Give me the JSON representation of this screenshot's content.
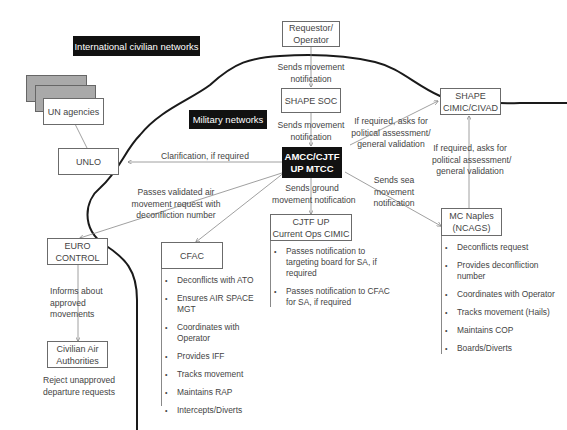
{
  "regions": {
    "civilian_label": "International civilian networks",
    "military_label": "Military networks"
  },
  "nodes": {
    "requestor": "Requestor/ Operator",
    "shape_soc": "SHAPE SOC",
    "amcc_line1": "AMCC/CJTF",
    "amcc_line2": "UP MTCC",
    "shape_cimic_line1": "SHAPE",
    "shape_cimic_line2": "CIMIC/CIVAD",
    "un_agencies": "UN agencies",
    "unlo": "UNLO",
    "euro_line1": "EURO",
    "euro_line2": "CONTROL",
    "civil_line1": "Civilian Air",
    "civil_line2": "Authorities",
    "cfac": "CFAC",
    "cjtf_line1": "CJTF UP",
    "cjtf_line2": "Current Ops CIMIC",
    "mc_line1": "MC Naples",
    "mc_line2": "(NCAGS)"
  },
  "edges": {
    "req_to_soc": [
      "Sends movement",
      "notification"
    ],
    "soc_to_amcc": [
      "Sends movement",
      "notification"
    ],
    "amcc_to_shape": [
      "If required, asks for",
      "political assessment/",
      "general validation"
    ],
    "mc_to_shape": [
      "If required, asks for",
      "political assessment/",
      "general validation"
    ],
    "amcc_to_unlo": "Clarification, if required",
    "amcc_to_euro": [
      "Passes validated air",
      "movement request with",
      "deconfliction number"
    ],
    "amcc_to_cjtf": [
      "Sends ground",
      "movement notification"
    ],
    "amcc_to_mc": [
      "Sends sea",
      "movement",
      "notification"
    ],
    "euro_to_civil": [
      "Informs about",
      "approved",
      "movements"
    ],
    "civil_note": [
      "Reject unapproved",
      "departure requests"
    ]
  },
  "lists": {
    "cfac": [
      "Deconflicts with ATO",
      "Ensures AIR SPACE MGT",
      "Coordinates with Operator",
      "Provides IFF",
      "Tracks movement",
      "Maintains RAP",
      "Intercepts/Diverts"
    ],
    "cjtf": [
      "Passes notification to targeting board for SA, if required",
      "Passes notification to CFAC for SA, if required"
    ],
    "mc": [
      "Deconflicts request",
      "Provides deconfliction number",
      "Coordinates with Operator",
      "Tracks movement (Hails)",
      "Maintains COP",
      "Boards/Diverts"
    ]
  }
}
